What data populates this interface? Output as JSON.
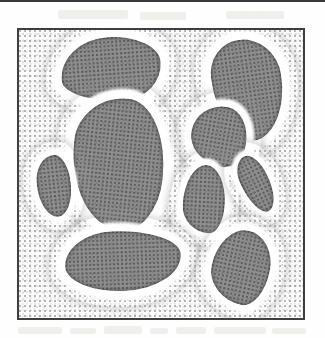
{
  "figure": {
    "kind": "stippled-micrograph-illustration",
    "caption": "",
    "label": "",
    "frame": {
      "x": 17,
      "y": 28,
      "width": 288,
      "height": 292,
      "border_color": "#3f3f3f",
      "border_width": 2
    },
    "colors": {
      "page_background": "#fefefe",
      "panel_background": "#fbfbfb",
      "matrix_stipple": "#7d7d7d",
      "blob_core": "#8e8e8e",
      "blob_rim": "#4e4e4e",
      "halo": "#ffffff",
      "frame": "#3f3f3f",
      "top_rule": "#3a3a3a",
      "bleed_smudge": "#e9e9e6"
    },
    "top_rule": {
      "x": 0,
      "y": 0,
      "width": 325,
      "height": 2
    },
    "smudges": [
      {
        "x": 18,
        "y": 327,
        "width": 44,
        "height": 7
      },
      {
        "x": 70,
        "y": 328,
        "width": 26,
        "height": 6
      },
      {
        "x": 104,
        "y": 326,
        "width": 38,
        "height": 8
      },
      {
        "x": 150,
        "y": 328,
        "width": 18,
        "height": 6
      },
      {
        "x": 176,
        "y": 327,
        "width": 30,
        "height": 7
      },
      {
        "x": 214,
        "y": 327,
        "width": 52,
        "height": 7
      },
      {
        "x": 272,
        "y": 328,
        "width": 34,
        "height": 6
      },
      {
        "x": 58,
        "y": 10,
        "width": 70,
        "height": 9
      },
      {
        "x": 140,
        "y": 12,
        "width": 46,
        "height": 8
      },
      {
        "x": 226,
        "y": 11,
        "width": 58,
        "height": 8
      }
    ],
    "blobs": [
      {
        "id": "blob-top-left-wedge",
        "name": "wedge",
        "x": 52,
        "y": 28,
        "width": 118,
        "height": 82,
        "core_inset": 9,
        "rotation": -4,
        "core_radius": "48% 52% 38% 62% / 62% 44% 56% 38%"
      },
      {
        "id": "blob-center-kidney",
        "name": "kidney",
        "x": 62,
        "y": 88,
        "width": 112,
        "height": 152,
        "core_inset": 10,
        "rotation": 6,
        "core_radius": "54% 46% 40% 60% / 36% 58% 42% 64%"
      },
      {
        "id": "blob-top-right-peanut",
        "name": "peanut",
        "x": 204,
        "y": 30,
        "width": 88,
        "height": 120,
        "core_inset": 9,
        "rotation": -8,
        "core_radius": "46% 54% 52% 48% / 34% 40% 60% 66%"
      },
      {
        "id": "blob-midright-triangle",
        "name": "rounded-triangle",
        "x": 183,
        "y": 98,
        "width": 72,
        "height": 76,
        "core_inset": 8,
        "rotation": 10,
        "core_radius": "56% 44% 36% 64% / 50% 58% 42% 50%"
      },
      {
        "id": "blob-left-teardrop",
        "name": "teardrop",
        "x": 30,
        "y": 148,
        "width": 48,
        "height": 76,
        "core_inset": 7,
        "rotation": -6,
        "core_radius": "58% 42% 46% 54% / 44% 48% 52% 56%"
      },
      {
        "id": "blob-center-bell",
        "name": "bell",
        "x": 176,
        "y": 158,
        "width": 56,
        "height": 82,
        "core_inset": 7,
        "rotation": 3,
        "core_radius": "52% 48% 34% 66% / 60% 56% 44% 40%"
      },
      {
        "id": "blob-right-sliver",
        "name": "sliver",
        "x": 236,
        "y": 148,
        "width": 40,
        "height": 72,
        "core_inset": 6,
        "rotation": -26,
        "core_radius": "56% 44% 52% 48% / 40% 44% 56% 60%"
      },
      {
        "id": "blob-bottom-dumbbell",
        "name": "dumbbell",
        "x": 56,
        "y": 222,
        "width": 134,
        "height": 78,
        "core_inset": 9,
        "rotation": -2,
        "core_radius": "42% 58% 50% 50% / 56% 42% 58% 44%"
      },
      {
        "id": "blob-bottom-right-crescent",
        "name": "crescent",
        "x": 204,
        "y": 222,
        "width": 74,
        "height": 90,
        "core_inset": 8,
        "rotation": 12,
        "core_radius": "50% 50% 36% 64% / 56% 48% 52% 44%"
      }
    ]
  }
}
